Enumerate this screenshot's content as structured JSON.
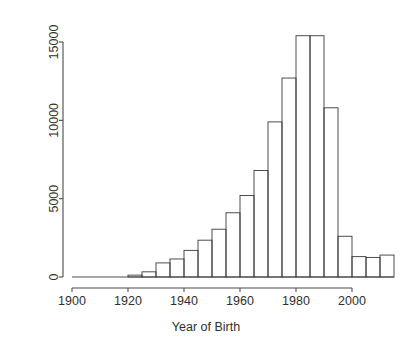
{
  "chart_data": {
    "type": "bar",
    "title": "",
    "subtitle": "",
    "xlabel": "Year of Birth",
    "ylabel": "",
    "xlim": [
      1900,
      2015
    ],
    "ylim": [
      0,
      15400
    ],
    "grid": false,
    "legend": null,
    "bin_width": 5,
    "x_ticks": [
      1900,
      1920,
      1940,
      1960,
      1980,
      2000
    ],
    "x_tick_labels": [
      "1900",
      "1920",
      "1940",
      "1960",
      "1980",
      "2000"
    ],
    "y_ticks": [
      0,
      5000,
      10000,
      15000
    ],
    "y_tick_labels": [
      "0",
      "5000",
      "10000",
      "15000"
    ],
    "bins": [
      {
        "start": 1920,
        "end": 1925,
        "value": 120
      },
      {
        "start": 1925,
        "end": 1930,
        "value": 330
      },
      {
        "start": 1930,
        "end": 1935,
        "value": 900
      },
      {
        "start": 1935,
        "end": 1940,
        "value": 1150
      },
      {
        "start": 1940,
        "end": 1945,
        "value": 1700
      },
      {
        "start": 1945,
        "end": 1950,
        "value": 2350
      },
      {
        "start": 1950,
        "end": 1955,
        "value": 3050
      },
      {
        "start": 1955,
        "end": 1960,
        "value": 4100
      },
      {
        "start": 1960,
        "end": 1965,
        "value": 5200
      },
      {
        "start": 1965,
        "end": 1970,
        "value": 6800
      },
      {
        "start": 1970,
        "end": 1975,
        "value": 9900
      },
      {
        "start": 1975,
        "end": 1980,
        "value": 12700
      },
      {
        "start": 1980,
        "end": 1985,
        "value": 15400
      },
      {
        "start": 1985,
        "end": 1990,
        "value": 15400
      },
      {
        "start": 1990,
        "end": 1995,
        "value": 10800
      },
      {
        "start": 1995,
        "end": 2000,
        "value": 2600
      },
      {
        "start": 2000,
        "end": 2005,
        "value": 1300
      },
      {
        "start": 2005,
        "end": 2010,
        "value": 1250
      },
      {
        "start": 2010,
        "end": 2015,
        "value": 1400
      }
    ],
    "categories": [
      "1920-1925",
      "1925-1930",
      "1930-1935",
      "1935-1940",
      "1940-1945",
      "1945-1950",
      "1950-1955",
      "1955-1960",
      "1960-1965",
      "1965-1970",
      "1970-1975",
      "1975-1980",
      "1980-1985",
      "1985-1990",
      "1990-1995",
      "1995-2000",
      "2000-2005",
      "2005-2010",
      "2010-2015"
    ],
    "values": [
      120,
      330,
      900,
      1150,
      1700,
      2350,
      3050,
      4100,
      5200,
      6800,
      9900,
      12700,
      15400,
      15400,
      10800,
      2600,
      1300,
      1250,
      1400
    ]
  },
  "colors": {
    "background": "#ffffff",
    "bar_stroke": "#3a3a3a",
    "axis": "#4a4a4a",
    "text": "#2f2f2f"
  }
}
